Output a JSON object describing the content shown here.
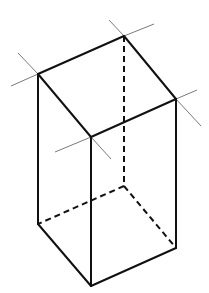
{
  "figure": {
    "colors": {
      "background": "#ffffff",
      "edge": "#111111",
      "construction_line": "#7a7a7a"
    },
    "vertices": {
      "top_left": [
        38,
        74
      ],
      "top_back": [
        124,
        36
      ],
      "top_right": [
        176,
        99
      ],
      "top_front": [
        91,
        137
      ],
      "bottom_left": [
        38,
        224
      ],
      "bottom_back": [
        124,
        186
      ],
      "bottom_right": [
        176,
        248
      ],
      "bottom_front": [
        91,
        286
      ]
    },
    "visible_edges": [
      {
        "name": "top-left-to-top-back",
        "from": [
          38,
          74
        ],
        "to": [
          124,
          36
        ]
      },
      {
        "name": "top-back-to-top-right",
        "from": [
          124,
          36
        ],
        "to": [
          176,
          99
        ]
      },
      {
        "name": "top-right-to-top-front",
        "from": [
          176,
          99
        ],
        "to": [
          91,
          137
        ]
      },
      {
        "name": "top-front-to-top-left",
        "from": [
          91,
          137
        ],
        "to": [
          38,
          74
        ]
      },
      {
        "name": "left-vertical",
        "from": [
          38,
          74
        ],
        "to": [
          38,
          224
        ]
      },
      {
        "name": "front-vertical",
        "from": [
          91,
          137
        ],
        "to": [
          91,
          286
        ]
      },
      {
        "name": "right-vertical",
        "from": [
          176,
          99
        ],
        "to": [
          176,
          248
        ]
      },
      {
        "name": "bottom-left-to-bottom-front",
        "from": [
          38,
          224
        ],
        "to": [
          91,
          286
        ]
      },
      {
        "name": "bottom-front-to-bottom-right",
        "from": [
          91,
          286
        ],
        "to": [
          176,
          248
        ]
      }
    ],
    "hidden_edges": [
      {
        "name": "back-vertical",
        "from": [
          124,
          36
        ],
        "to": [
          124,
          186
        ]
      },
      {
        "name": "bottom-back-to-bottom-left",
        "from": [
          124,
          186
        ],
        "to": [
          38,
          224
        ]
      },
      {
        "name": "bottom-back-to-bottom-right",
        "from": [
          124,
          186
        ],
        "to": [
          176,
          248
        ]
      }
    ],
    "construction_lines": [
      {
        "name": "top-left-ext-up",
        "from": [
          38,
          74
        ],
        "to": [
          18,
          53
        ]
      },
      {
        "name": "top-left-ext-down",
        "from": [
          38,
          74
        ],
        "to": [
          11,
          86
        ]
      },
      {
        "name": "top-back-ext-left",
        "from": [
          124,
          36
        ],
        "to": [
          109,
          20
        ]
      },
      {
        "name": "top-back-ext-right",
        "from": [
          124,
          36
        ],
        "to": [
          154,
          24
        ]
      },
      {
        "name": "top-right-ext-up",
        "from": [
          176,
          99
        ],
        "to": [
          197,
          90
        ]
      },
      {
        "name": "top-right-ext-down",
        "from": [
          176,
          99
        ],
        "to": [
          201,
          126
        ]
      },
      {
        "name": "top-front-ext-left",
        "from": [
          91,
          137
        ],
        "to": [
          55,
          152
        ]
      },
      {
        "name": "top-front-ext-right",
        "from": [
          91,
          137
        ],
        "to": [
          111,
          159
        ]
      }
    ]
  }
}
